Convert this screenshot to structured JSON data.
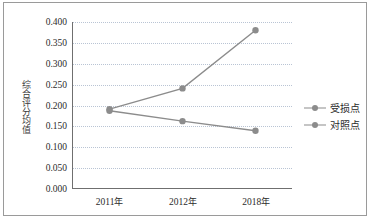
{
  "chart_data": {
    "type": "line",
    "title": "",
    "xlabel": "",
    "ylabel": "综合评分均值",
    "categories": [
      "2011年",
      "2012年",
      "2018年"
    ],
    "series": [
      {
        "name": "受损点",
        "values": [
          0.19,
          0.24,
          0.38
        ],
        "color": "#8c8c8c"
      },
      {
        "name": "对照点",
        "values": [
          0.186,
          0.161,
          0.138
        ],
        "color": "#8c8c8c"
      }
    ],
    "ylim": [
      0.0,
      0.4
    ],
    "ytick_labels": [
      "0.400",
      "0.350",
      "0.300",
      "0.250",
      "0.200",
      "0.150",
      "0.100",
      "0.050",
      "0.000"
    ],
    "ytick_values": [
      0.4,
      0.35,
      0.3,
      0.25,
      0.2,
      0.15,
      0.1,
      0.05,
      0.0
    ],
    "grid": true,
    "grid_color": "#b9c4d4",
    "legend_position": "right",
    "axis_color": "#6f6f6f",
    "frame_color": "#9a9a9a"
  },
  "legend": {
    "items": [
      {
        "label": "受损点"
      },
      {
        "label": "对照点"
      }
    ]
  }
}
